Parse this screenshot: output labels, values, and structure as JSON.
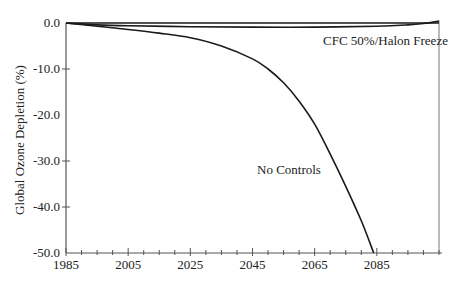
{
  "chart_data": {
    "type": "line",
    "title": "",
    "xlabel": "",
    "ylabel": "Global Ozone Depletion (%)",
    "xlim": [
      1985,
      2105
    ],
    "ylim": [
      -50,
      0
    ],
    "x_ticks": [
      1985,
      2005,
      2025,
      2045,
      2065,
      2085
    ],
    "x_tick_labels": [
      "1985",
      "2005",
      "2025",
      "2045",
      "2065",
      "2085"
    ],
    "x_minor_step": 5,
    "y_ticks": [
      0,
      -10,
      -20,
      -30,
      -40,
      -50
    ],
    "y_tick_labels": [
      "0.0",
      "-10.0",
      "-20.0",
      "-30.0",
      "-40.0",
      "-50.0"
    ],
    "grid": false,
    "legend": "none (inline annotations)",
    "series": [
      {
        "name": "No Controls",
        "x": [
          1985,
          1995,
          2005,
          2015,
          2025,
          2035,
          2045,
          2050,
          2055,
          2060,
          2065,
          2070,
          2075,
          2080,
          2084
        ],
        "y": [
          0,
          -0.7,
          -1.4,
          -2.2,
          -3.2,
          -5.0,
          -7.8,
          -10.0,
          -13.0,
          -17.0,
          -22.0,
          -28.5,
          -35.5,
          -43.0,
          -50.0
        ]
      },
      {
        "name": "CFC 50%/Halon Freeze",
        "x": [
          1985,
          1995,
          2005,
          2025,
          2045,
          2065,
          2085,
          2095,
          2100,
          2105
        ],
        "y": [
          0,
          -0.4,
          -0.6,
          -0.8,
          -0.9,
          -0.9,
          -0.7,
          -0.4,
          -0.1,
          0.4
        ]
      },
      {
        "name": "Zero reference",
        "x": [
          1985,
          2105
        ],
        "y": [
          0,
          0
        ]
      }
    ],
    "annotations": [
      {
        "text": "CFC 50%/Halon Freeze",
        "x": 2070,
        "y": -3.5
      },
      {
        "text": "No Controls",
        "x": 2058,
        "y": -25.0
      }
    ]
  },
  "labels": {
    "ylabel": "Global Ozone Depletion (%)",
    "cfc_annotation": "CFC 50%/Halon Freeze",
    "nocontrols_annotation": "No Controls"
  }
}
